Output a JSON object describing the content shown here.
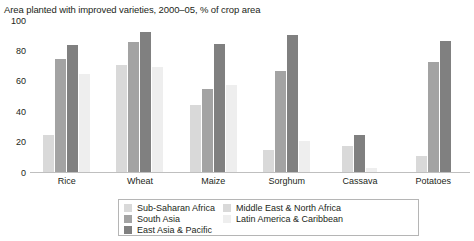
{
  "chart_data": {
    "type": "bar",
    "title": "Area planted with improved varieties, 2000–05, % of crop area",
    "xlabel": "",
    "ylabel": "",
    "ylim": [
      0,
      100
    ],
    "yticks": [
      100,
      80,
      60,
      40,
      20,
      0
    ],
    "grid": false,
    "legend_position": "bottom",
    "categories": [
      "Rice",
      "Wheat",
      "Maize",
      "Sorghum",
      "Cassava",
      "Potatoes"
    ],
    "series": [
      {
        "name": "Sub-Saharan Africa",
        "color": "#d9d9d9",
        "values": [
          25,
          71,
          45,
          15,
          18,
          11
        ]
      },
      {
        "name": "South Asia",
        "color": "#a3a3a3",
        "values": [
          75,
          86,
          55,
          67,
          0,
          73
        ]
      },
      {
        "name": "East Asia & Pacific",
        "color": "#808080",
        "values": [
          84,
          93,
          85,
          91,
          25,
          87
        ]
      },
      {
        "name": "Middle East & North Africa",
        "color": "#d9d9d9",
        "values": [
          0,
          0,
          0,
          0,
          0,
          0
        ]
      },
      {
        "name": "Latin America & Caribbean",
        "color": "#eeeeee",
        "values": [
          65,
          70,
          58,
          21,
          3,
          0
        ]
      }
    ]
  },
  "legend": {
    "column_left": [
      "Sub-Saharan Africa",
      "South Asia",
      "East Asia & Pacific"
    ],
    "column_right": [
      "Middle East & North Africa",
      "Latin America & Caribbean"
    ]
  }
}
